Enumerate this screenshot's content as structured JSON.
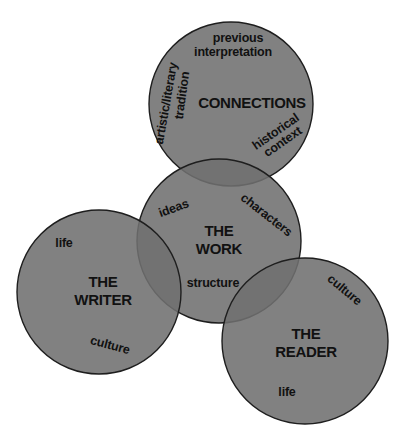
{
  "colors": {
    "background": "#ffffff",
    "circle_fill": "#7b7b7b",
    "circle_stroke": "#1e1e1e",
    "text": "#111111"
  },
  "circles": {
    "connections": {
      "title": "CONNECTIONS",
      "items": [
        "previous",
        "interpretation",
        "artistic/literary",
        "tradition",
        "historical",
        "context"
      ]
    },
    "work": {
      "title_line1": "THE",
      "title_line2": "WORK",
      "items": [
        "ideas",
        "characters",
        "structure"
      ]
    },
    "writer": {
      "title_line1": "THE",
      "title_line2": "WRITER",
      "items": [
        "life",
        "culture"
      ]
    },
    "reader": {
      "title_line1": "THE",
      "title_line2": "READER",
      "items": [
        "culture",
        "life"
      ]
    }
  }
}
